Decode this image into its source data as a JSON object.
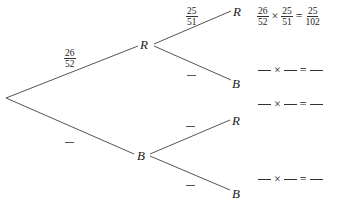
{
  "tree": {
    "first_draw": {
      "red_branch": {
        "label": "R",
        "prob": {
          "num": "26",
          "den": "52"
        }
      },
      "black_branch": {
        "label": "B",
        "prob": null
      }
    },
    "second_draw": {
      "after_red": {
        "red": {
          "label": "R",
          "prob": {
            "num": "25",
            "den": "51"
          }
        },
        "black": {
          "label": "B",
          "prob": null
        }
      },
      "after_black": {
        "red": {
          "label": "R",
          "prob": null
        },
        "black": {
          "label": "B",
          "prob": null
        }
      }
    }
  },
  "outcomes": [
    {
      "f1": {
        "num": "26",
        "den": "52"
      },
      "times": "×",
      "f2": {
        "num": "25",
        "den": "51"
      },
      "equals": "=",
      "result": {
        "num": "25",
        "den": "102"
      }
    },
    {
      "blank": true,
      "times": "×",
      "equals": "="
    },
    {
      "blank": true,
      "times": "×",
      "equals": "="
    },
    {
      "blank": true,
      "times": "×",
      "equals": "="
    }
  ],
  "colors": {
    "line": "#555555",
    "text": "#222222"
  }
}
